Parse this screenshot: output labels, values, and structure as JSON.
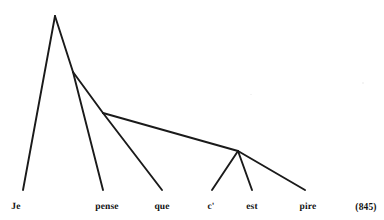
{
  "figure": {
    "kind": "dependency-syntax-tree",
    "language_sample": "Je pense que c' est pire",
    "example_number": "(845)",
    "background_color": "#ffffff",
    "line_color": "#1a1a1a",
    "text_color": "#111111"
  },
  "leaves": [
    {
      "id": "leaf-je",
      "label": "Je",
      "x": 16,
      "y": 203,
      "terminal_x": 23,
      "terminal_y": 190
    },
    {
      "id": "leaf-pense",
      "label": "pense",
      "x": 107,
      "y": 203,
      "terminal_x": 103,
      "terminal_y": 190
    },
    {
      "id": "leaf-que",
      "label": "que",
      "x": 162,
      "y": 203,
      "terminal_x": 162,
      "terminal_y": 190
    },
    {
      "id": "leaf-ce",
      "label": "c'",
      "x": 211,
      "y": 203,
      "terminal_x": 212,
      "terminal_y": 190
    },
    {
      "id": "leaf-est",
      "label": "est",
      "x": 252,
      "y": 203,
      "terminal_x": 252,
      "terminal_y": 190
    },
    {
      "id": "leaf-pire",
      "label": "pire",
      "x": 308,
      "y": 203,
      "terminal_x": 305,
      "terminal_y": 190
    }
  ],
  "nodes": [
    {
      "id": "node-root",
      "x": 55,
      "y": 16
    },
    {
      "id": "node-n2",
      "x": 73,
      "y": 72
    },
    {
      "id": "node-n3",
      "x": 103,
      "y": 113
    },
    {
      "id": "node-n4",
      "x": 238,
      "y": 151
    }
  ],
  "edges": [
    {
      "id": "edge-root-je",
      "from": "node-root",
      "to": "leaf-je",
      "x1": 55,
      "y1": 16,
      "x2": 23,
      "y2": 190
    },
    {
      "id": "edge-root-n2",
      "from": "node-root",
      "to": "node-n2",
      "x1": 55,
      "y1": 16,
      "x2": 73,
      "y2": 72
    },
    {
      "id": "edge-n2-pense",
      "from": "node-n2",
      "to": "leaf-pense",
      "x1": 73,
      "y1": 72,
      "x2": 103,
      "y2": 190
    },
    {
      "id": "edge-n2-n3",
      "from": "node-n2",
      "to": "node-n3",
      "x1": 73,
      "y1": 72,
      "x2": 103,
      "y2": 113
    },
    {
      "id": "edge-n3-que",
      "from": "node-n3",
      "to": "leaf-que",
      "x1": 103,
      "y1": 113,
      "x2": 162,
      "y2": 190
    },
    {
      "id": "edge-n3-n4",
      "from": "node-n3",
      "to": "node-n4",
      "x1": 103,
      "y1": 113,
      "x2": 238,
      "y2": 151
    },
    {
      "id": "edge-n4-ce",
      "from": "node-n4",
      "to": "leaf-ce",
      "x1": 238,
      "y1": 151,
      "x2": 212,
      "y2": 190
    },
    {
      "id": "edge-n4-est",
      "from": "node-n4",
      "to": "leaf-est",
      "x1": 238,
      "y1": 151,
      "x2": 252,
      "y2": 190
    },
    {
      "id": "edge-n4-pire",
      "from": "node-n4",
      "to": "leaf-pire",
      "x1": 238,
      "y1": 151,
      "x2": 305,
      "y2": 190
    }
  ],
  "example_label": {
    "text": "(845)",
    "x": 366,
    "y": 203
  }
}
